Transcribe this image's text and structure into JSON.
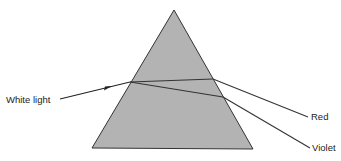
{
  "diagram": {
    "prism": {
      "fill": "#b3b3b3",
      "stroke": "#333333"
    },
    "labels": {
      "incoming": "White light",
      "ray_red": "Red",
      "ray_violet": "Violet"
    }
  }
}
